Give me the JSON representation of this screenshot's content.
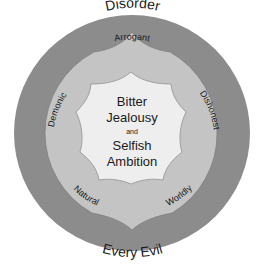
{
  "diagram": {
    "outer_ring": {
      "top_label": "Disorder",
      "bottom_label": "Every Evil"
    },
    "middle_ring": {
      "labels": {
        "top": "Arrogant",
        "right": "Dishonest",
        "bottom_right": "Worldly",
        "bottom_left": "Natural",
        "left": "Demonic"
      }
    },
    "center": {
      "line1": "Bitter",
      "line2": "Jealousy",
      "line3": "and",
      "line4": "Selfish",
      "line5": "Ambition"
    },
    "colors": {
      "outer": "#8c8c8c",
      "middle": "#c4c4c4",
      "center": "#eeeeee",
      "text": "#1a1a1a",
      "background": "#ffffff"
    }
  }
}
